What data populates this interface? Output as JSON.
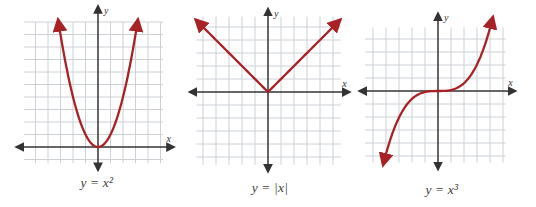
{
  "styles": {
    "curve_color": "#a82125",
    "grid_color": "#ccd1d6",
    "axis_color": "#333333",
    "caption_color": "#3d3d3d"
  },
  "chart_data": [
    {
      "type": "line",
      "title": "y = x²",
      "function": "y = x^2",
      "xlabel": "x",
      "ylabel": "y",
      "xlim": [
        -6,
        5
      ],
      "ylim": [
        -1,
        10
      ],
      "grid": true,
      "x": [
        -3,
        -2,
        -1,
        0,
        1,
        2,
        3
      ],
      "y": [
        9,
        4,
        1,
        0,
        1,
        4,
        9
      ],
      "caption": {
        "lhs": "y",
        "eq": "=",
        "rhs": "x²"
      }
    },
    {
      "type": "line",
      "title": "y = |x|",
      "function": "y = |x|",
      "xlabel": "x",
      "ylabel": "y",
      "xlim": [
        -6,
        6
      ],
      "ylim": [
        -6,
        6
      ],
      "grid": true,
      "x": [
        -5,
        -4,
        -3,
        -2,
        -1,
        0,
        1,
        2,
        3,
        4,
        5
      ],
      "y": [
        5,
        4,
        3,
        2,
        1,
        0,
        1,
        2,
        3,
        4,
        5
      ],
      "caption": {
        "lhs": "y",
        "eq": "=",
        "rhs": "|x|"
      }
    },
    {
      "type": "line",
      "title": "y = x³",
      "function": "y = x^3",
      "xlabel": "x",
      "ylabel": "y",
      "xlim": [
        -6,
        5
      ],
      "ylim": [
        -5,
        5
      ],
      "grid": true,
      "x": [
        -2,
        -1,
        0,
        1,
        2
      ],
      "y": [
        -8,
        -1,
        0,
        1,
        8
      ],
      "caption": {
        "lhs": "y",
        "eq": "=",
        "rhs": "x³"
      }
    }
  ]
}
